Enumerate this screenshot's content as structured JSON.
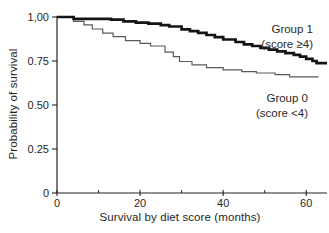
{
  "figure": {
    "background": "#ffffff",
    "axis_color": "#242424",
    "text_color": "#1f1f1f"
  },
  "y_axis": {
    "title": "Probability of survival",
    "ticks": [
      {
        "label": "1,00",
        "value": 1.0
      },
      {
        "label": "0.75",
        "value": 0.75
      },
      {
        "label": "0.50",
        "value": 0.5
      },
      {
        "label": "0.25",
        "value": 0.25
      },
      {
        "label": "0",
        "value": 0
      }
    ]
  },
  "x_axis": {
    "title": "Survival by diet score (months)",
    "major_ticks": [
      {
        "label": "0",
        "value": 0
      },
      {
        "label": "20",
        "value": 20
      },
      {
        "label": "40",
        "value": 40
      },
      {
        "label": "60",
        "value": 60
      }
    ],
    "minor_ticks": [
      10,
      30,
      50
    ]
  },
  "legend": {
    "group1": {
      "name": "Group 1",
      "score": "(score ≥4)"
    },
    "group0": {
      "name": "Group 0",
      "score": "(score <4)"
    }
  },
  "chart_data": {
    "type": "line",
    "subtype": "kaplan-meier-step",
    "title": "",
    "xlabel": "Survival by diet score (months)",
    "ylabel": "Probability of survival",
    "xlim": [
      0,
      65
    ],
    "ylim": [
      0,
      1
    ],
    "grid": false,
    "legend_position": "right-inline-annotations",
    "series": [
      {
        "name": "Group 0 (score <4)",
        "color": "#5a5a5a",
        "stroke_width": 1.2,
        "end_time": 63,
        "steps": [
          [
            0,
            1.0
          ],
          [
            4,
            0.975
          ],
          [
            6.5,
            0.955
          ],
          [
            8.5,
            0.932
          ],
          [
            11,
            0.908
          ],
          [
            13.5,
            0.888
          ],
          [
            16.5,
            0.866
          ],
          [
            20,
            0.85
          ],
          [
            22.5,
            0.835
          ],
          [
            26,
            0.8
          ],
          [
            28,
            0.775
          ],
          [
            29.5,
            0.747
          ],
          [
            32.5,
            0.728
          ],
          [
            36,
            0.712
          ],
          [
            40,
            0.7
          ],
          [
            44.5,
            0.69
          ],
          [
            48,
            0.682
          ],
          [
            52.5,
            0.672
          ],
          [
            56,
            0.66
          ]
        ]
      },
      {
        "name": "Group 1 (score ≥4)",
        "color": "#141414",
        "stroke_width": 2.7,
        "end_time": 65,
        "steps": [
          [
            0,
            1.0
          ],
          [
            4,
            0.99
          ],
          [
            13,
            0.985
          ],
          [
            16,
            0.975
          ],
          [
            19,
            0.968
          ],
          [
            22,
            0.962
          ],
          [
            25,
            0.954
          ],
          [
            27,
            0.946
          ],
          [
            30,
            0.93
          ],
          [
            32,
            0.92
          ],
          [
            34,
            0.91
          ],
          [
            36,
            0.898
          ],
          [
            38,
            0.885
          ],
          [
            40,
            0.872
          ],
          [
            43,
            0.858
          ],
          [
            45,
            0.845
          ],
          [
            47,
            0.835
          ],
          [
            49,
            0.825
          ],
          [
            51,
            0.815
          ],
          [
            53,
            0.805
          ],
          [
            55,
            0.795
          ],
          [
            57,
            0.785
          ],
          [
            58.5,
            0.775
          ],
          [
            60,
            0.762
          ],
          [
            61.5,
            0.75
          ],
          [
            62.5,
            0.738
          ]
        ]
      }
    ]
  }
}
